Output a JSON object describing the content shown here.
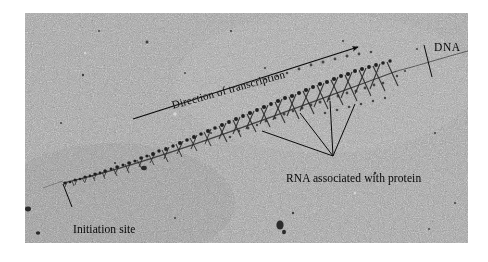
{
  "figure": {
    "kind": "electron-micrograph",
    "plate": {
      "x": 25,
      "y": 13,
      "width": 443,
      "height": 230,
      "background_color": "#9d9d9d",
      "grain_color_dark": "#3a3a3a",
      "grain_color_light": "#c9c9c9"
    }
  },
  "annotations": {
    "direction": {
      "label": "Direction of transcription",
      "arrow": {
        "x1": 133,
        "y1": 119,
        "x2": 358,
        "y2": 47
      },
      "rotation_deg": -15.6,
      "color": "#0a0a0a"
    },
    "dna": {
      "label": "DNA",
      "leader": {
        "x1": 424,
        "y1": 45,
        "x2": 432,
        "y2": 77
      },
      "color": "#0a0a0a"
    },
    "rna": {
      "label": "RNA associated with protein",
      "converge": {
        "x": 333,
        "y": 156
      },
      "leaders": [
        {
          "x2": 262,
          "y2": 131
        },
        {
          "x2": 300,
          "y2": 113
        },
        {
          "x2": 330,
          "y2": 101
        },
        {
          "x2": 355,
          "y2": 104
        }
      ],
      "color": "#0a0a0a"
    },
    "initiation": {
      "label": "Initiation site",
      "leader": {
        "x1": 72,
        "y1": 207,
        "x2": 63,
        "y2": 184
      },
      "color": "#0a0a0a"
    }
  },
  "strand": {
    "name": "dna-axis-with-transcripts",
    "path_start": {
      "x": 63,
      "y": 184
    },
    "path_end": {
      "x": 468,
      "y": 58
    },
    "naked_dna_right": {
      "x1": 400,
      "y1": 68,
      "x2": 468,
      "y2": 52
    },
    "transcript_count_visible": 118,
    "description": "Christmas-tree pattern: nascent RNA fibrils increase in length from the initiation site toward the direction of transcription"
  }
}
